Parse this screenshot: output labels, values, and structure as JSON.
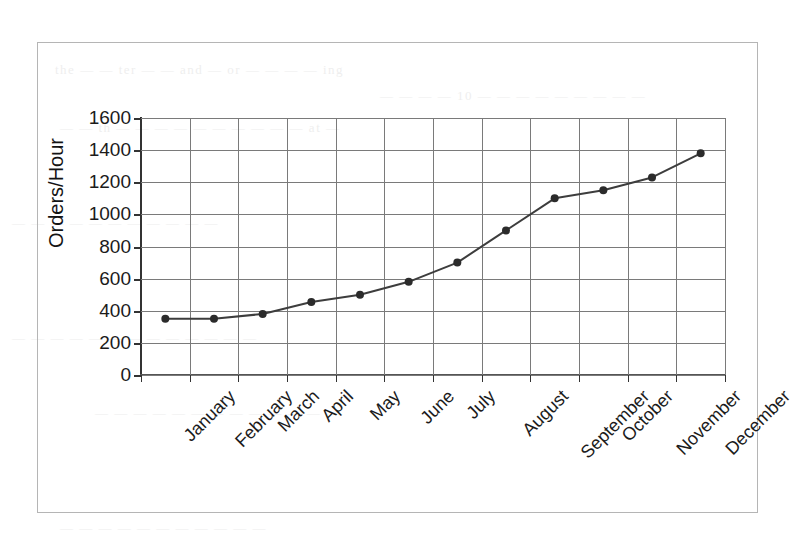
{
  "figure": {
    "frame_border_color": "#b5b5b5",
    "background_color": "#ffffff"
  },
  "chart_data": {
    "type": "line",
    "title": "",
    "subtitle": "",
    "xlabel": "",
    "ylabel": "Orders/Hour",
    "categories": [
      "January",
      "February",
      "March",
      "April",
      "May",
      "June",
      "July",
      "August",
      "September",
      "October",
      "November",
      "December"
    ],
    "values": [
      350,
      350,
      380,
      455,
      500,
      580,
      700,
      900,
      1100,
      1150,
      1230,
      1380
    ],
    "series": [
      {
        "name": "Orders/Hour",
        "values": [
          350,
          350,
          380,
          455,
          500,
          580,
          700,
          900,
          1100,
          1150,
          1230,
          1380
        ]
      }
    ],
    "ylim": [
      0,
      1600
    ],
    "y_ticks": [
      0,
      200,
      400,
      600,
      800,
      1000,
      1200,
      1400,
      1600
    ],
    "y_tick_labels": [
      "0",
      "200",
      "400",
      "600",
      "800",
      "1000",
      "1200",
      "1400",
      "1600"
    ],
    "grid": true,
    "grid_horizontal": true,
    "grid_vertical": true,
    "legend": false,
    "legend_position": "none",
    "line_color": "#3d3d3d",
    "marker": "circle",
    "marker_color": "#2b2b2b",
    "grid_color": "#7a7a7a",
    "axis_color": "#333333",
    "x_tick_label_rotation": -45
  },
  "scan_artifacts": {
    "ghost_text": [
      "the — — ter — — and — or — — — — ing",
      "— — — — 10 — — — — — — — — —",
      "— — th — — — — — — — — — — at —",
      "— — — — — — — — — — —",
      "— — — — — — — — — — — — —",
      "— — — — — — — — — — — —",
      "— — — — — — — — — — —"
    ]
  }
}
